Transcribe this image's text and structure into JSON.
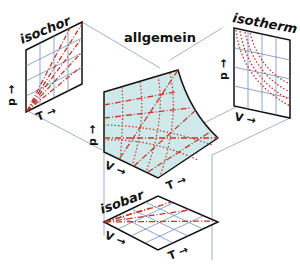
{
  "diagram": {
    "panels": {
      "isochor": {
        "title": "isochor",
        "x_axis": "T",
        "y_axis": "p",
        "curve_style": "dash-dot lines through origin"
      },
      "allgemein": {
        "title": "allgemein",
        "axes": [
          "p",
          "V",
          "T"
        ],
        "curve_style": "dotted isotherms, dash-dot isobars/isochors"
      },
      "isotherm": {
        "title": "isotherm",
        "x_axis": "V",
        "y_axis": "p",
        "curve_style": "dotted hyperbolae"
      },
      "isobar": {
        "title": "isobar",
        "x_axis": "T",
        "y_axis": "V",
        "curve_style": "dash-dot lines through origin"
      }
    },
    "colors": {
      "outline": "#111111",
      "grid": "#5b7fb8",
      "curves": "#c0392b",
      "surface_fill": "#cfe8ea",
      "projection_lines": "#8a9bc4"
    }
  }
}
